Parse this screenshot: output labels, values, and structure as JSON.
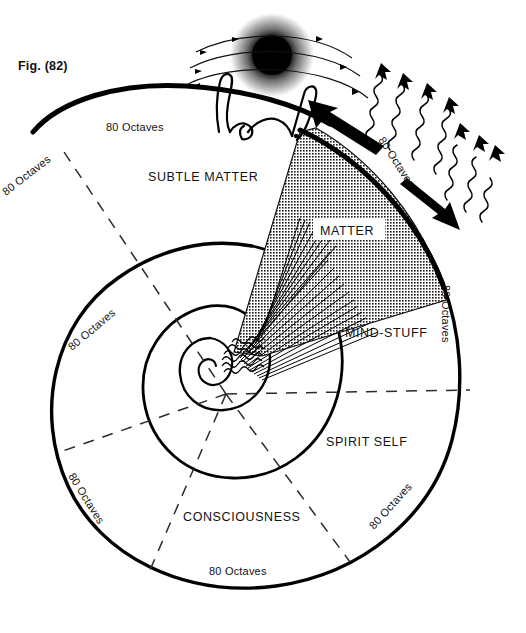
{
  "figure": {
    "caption": "Fig. (82)",
    "title": "Fig. (82)",
    "background": "#ffffff",
    "ink": "#000000"
  },
  "regions": [
    {
      "id": "matter",
      "label": "MATTER",
      "fill": "dotted-screen"
    },
    {
      "id": "subtle-matter",
      "label": "SUBTLE MATTER",
      "fill": "white"
    },
    {
      "id": "mind-stuff",
      "label": "MIND-STUFF",
      "fill": "white"
    },
    {
      "id": "spirit-self",
      "label": "SPIRIT SELF",
      "fill": "white"
    },
    {
      "id": "consciousness",
      "label": "CONSCIOUSNESS",
      "fill": "white"
    }
  ],
  "octave_labels": [
    {
      "id": "oct-top",
      "text": "80 Octaves",
      "rotation": 0
    },
    {
      "id": "oct-upper-left",
      "text": "80 Octaves",
      "rotation": -38
    },
    {
      "id": "oct-mid-left",
      "text": "80 Octaves",
      "rotation": -40
    },
    {
      "id": "oct-lower-left",
      "text": "80 Octaves",
      "rotation": 58
    },
    {
      "id": "oct-bottom",
      "text": "80 Octaves",
      "rotation": 0
    },
    {
      "id": "oct-lower-right",
      "text": "80 Octaves",
      "rotation": -48
    },
    {
      "id": "oct-mid-right",
      "text": "80 Octaves",
      "rotation": 90
    },
    {
      "id": "oct-radiation",
      "text": "80 Octaves",
      "rotation": 57
    }
  ],
  "glyphs": {
    "sun": "sun-disc",
    "human": "human-figure-arms-raised",
    "radiation": "wavy-arrows",
    "inflow_arrow": "solid-arrow-up-left",
    "outflow_arrow": "solid-arrow-down-right",
    "core": "logarithmic-spiral"
  },
  "counts": {
    "wavy_arrows": 7,
    "dashed_radials": 8,
    "sun_orbit_arcs": 3
  }
}
